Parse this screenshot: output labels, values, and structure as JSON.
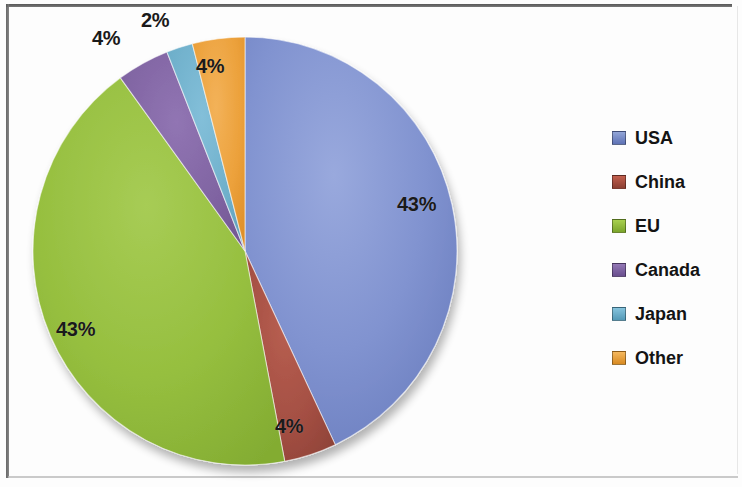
{
  "chart_data": {
    "type": "pie",
    "title": "",
    "subtitle": "",
    "categories": [
      "USA",
      "China",
      "EU",
      "Canada",
      "Japan",
      "Other"
    ],
    "values": [
      43,
      4,
      43,
      4,
      2,
      4
    ],
    "value_labels": [
      "43%",
      "4%",
      "43%",
      "4%",
      "2%",
      "4%"
    ],
    "units": "percent",
    "colors": [
      "#7f92ce",
      "#a44f42",
      "#97c040",
      "#8064a2",
      "#6fb0cb",
      "#eda23c"
    ],
    "legend": {
      "position": "right",
      "entries": [
        {
          "label": "USA",
          "color": "#7f92ce",
          "value": 43
        },
        {
          "label": "China",
          "color": "#a44f42",
          "value": 4
        },
        {
          "label": "EU",
          "color": "#97c040",
          "value": 43
        },
        {
          "label": "Canada",
          "color": "#8064a2",
          "value": 4
        },
        {
          "label": "Japan",
          "color": "#6fb0cb",
          "value": 2
        },
        {
          "label": "Other",
          "color": "#eda23c",
          "value": 4
        }
      ]
    },
    "grid": false,
    "start_angle_deg": -90,
    "direction": "clockwise",
    "shape": "ellipse",
    "labels_inside": true
  },
  "labels": {
    "usa_pct": "43%",
    "china_pct": "4%",
    "eu_pct": "43%",
    "canada_pct": "4%",
    "japan_pct": "2%",
    "other_pct": "4%"
  },
  "legend_items": {
    "0": {
      "label": "USA"
    },
    "1": {
      "label": "China"
    },
    "2": {
      "label": "EU"
    },
    "3": {
      "label": "Canada"
    },
    "4": {
      "label": "Japan"
    },
    "5": {
      "label": "Other"
    }
  }
}
